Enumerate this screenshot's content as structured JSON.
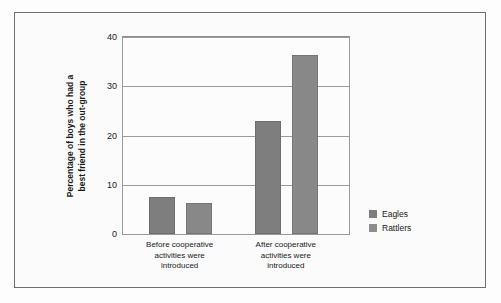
{
  "chart_data": {
    "type": "bar",
    "title": "",
    "subtitle": "",
    "xlabel": "",
    "ylabel": "Percentage of boys who had a best friend in the out-group",
    "ylabel_lines": [
      "Percentage of boys who had a",
      "best friend in the out-group"
    ],
    "categories": [
      "Before cooperative activities were introduced",
      "After cooperative activities were introduced"
    ],
    "category_lines": [
      [
        "Before cooperative",
        "activities were",
        "introduced"
      ],
      [
        "After cooperative",
        "activities were",
        "introduced"
      ]
    ],
    "series": [
      {
        "name": "Eagles",
        "values": [
          7.5,
          23
        ],
        "color": "#7e7e7e"
      },
      {
        "name": "Rattlers",
        "values": [
          6.2,
          36.3
        ],
        "color": "#8d8d8d"
      }
    ],
    "ylim": [
      0,
      40
    ],
    "yticks": [
      0,
      10,
      20,
      30,
      40
    ],
    "ytick_labels": [
      "0",
      "10",
      "20",
      "30",
      "40"
    ],
    "grid": true,
    "grid_axis": "y",
    "legend": {
      "position": "right",
      "entries": [
        "Eagles",
        "Rattlers"
      ]
    },
    "annotations": []
  },
  "legend": {
    "entries": [
      {
        "label": "Eagles"
      },
      {
        "label": "Rattlers"
      }
    ]
  }
}
